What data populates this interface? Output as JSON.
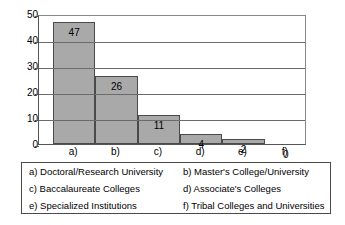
{
  "chart_data": {
    "type": "bar",
    "title": "",
    "subtitle": "",
    "xlabel": "",
    "ylabel": "",
    "categories": [
      "a)",
      "b)",
      "c)",
      "d)",
      "e)",
      "f)"
    ],
    "values": [
      47,
      26,
      11,
      4,
      2,
      0
    ],
    "ylim": [
      0,
      50
    ],
    "yticks": [
      "0",
      "10",
      "20",
      "30",
      "40",
      "50"
    ],
    "ytick_values": [
      0,
      10,
      20,
      30,
      40,
      50
    ],
    "grid": "horizontal",
    "legend_position": "below-plot",
    "bar_fill_color": "#a9a9a9",
    "bar_edge_color": "#4a4a4a",
    "gridline_color": "#6b6b6b",
    "data_labels": [
      "47",
      "26",
      "11",
      "4",
      "2",
      "0"
    ],
    "legend_entries": [
      {
        "key": "a)",
        "label": "a) Doctoral/Research University"
      },
      {
        "key": "b)",
        "label": "b) Master's College/University"
      },
      {
        "key": "c)",
        "label": "c) Baccalaureate Colleges"
      },
      {
        "key": "d)",
        "label": "d) Associate's Colleges"
      },
      {
        "key": "e)",
        "label": "e) Specialized Institutions"
      },
      {
        "key": "f)",
        "label": "f) Tribal Colleges and Universities"
      }
    ]
  }
}
